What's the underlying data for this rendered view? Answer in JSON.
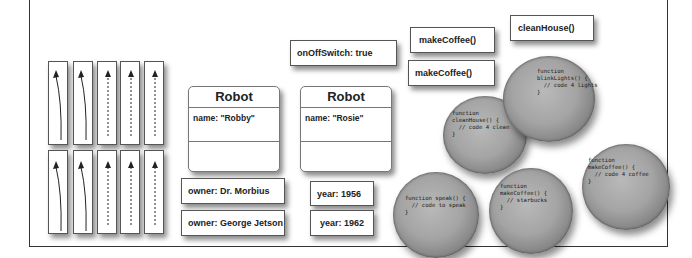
{
  "frame": {
    "stroke": "#333333"
  },
  "arrow_cards": {
    "rows": [
      [
        "solid-curved",
        "solid-curved",
        "dashed-straight",
        "dashed-straight",
        "dashed-straight"
      ],
      [
        "solid-curved",
        "solid-curved",
        "dashed-straight",
        "dashed-straight",
        "dashed-straight"
      ]
    ]
  },
  "robots": [
    {
      "title": "Robot",
      "attr": "name: \"Robby\""
    },
    {
      "title": "Robot",
      "attr": "name: \"Rosie\""
    }
  ],
  "labels": {
    "owner1": "owner: Dr. Morbius",
    "owner2": "owner: George Jetson",
    "year1": "year: 1956",
    "year2": "year: 1962",
    "switch": "onOffSwitch: true",
    "make1": "makeCoffee()",
    "make2": "makeCoffee()",
    "clean": "cleanHouse()"
  },
  "functions": {
    "clean_house": "function\ncleanHouse() {\n  // code 4 clean\n}",
    "blink_lights": "function\nblinkLights() {\n  // code 4 lights\n}",
    "speak": "function speak() {\n  // code to speak\n}",
    "starbucks": "function\nmakeCoffee() {\n  // starbucks\n}",
    "make_coffee": "function\nmakeCoffee() {\n  // code 4 coffee\n}"
  }
}
